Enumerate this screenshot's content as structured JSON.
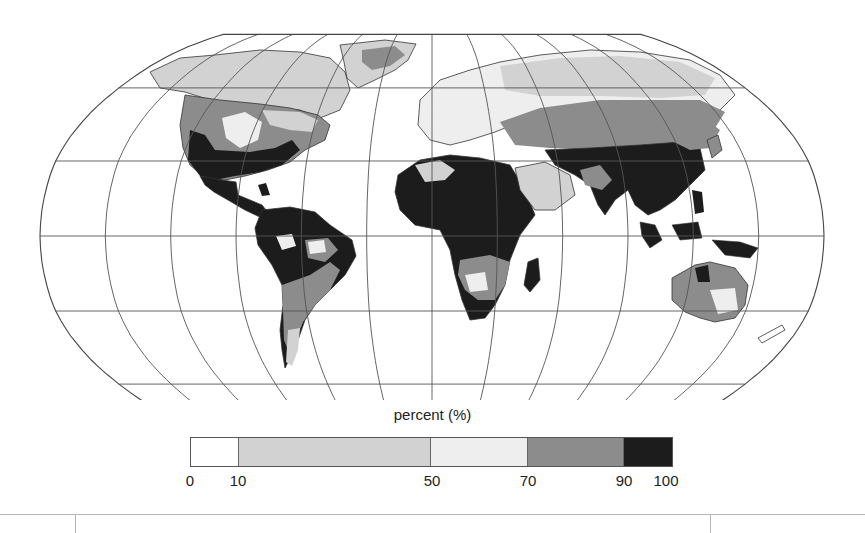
{
  "figure": {
    "type": "choropleth-world-map",
    "projection": "Robinson",
    "graticule": {
      "lon_step_deg": 30,
      "lat_step_deg": 30
    }
  },
  "legend": {
    "title": "percent (%)",
    "ticks": [
      "0",
      "10",
      "50",
      "70",
      "90",
      "100"
    ],
    "bins": [
      {
        "range": "0-10",
        "from": 0,
        "to": 10,
        "color": "#ffffff"
      },
      {
        "range": "10-50",
        "from": 10,
        "to": 50,
        "color": "#d2d2d2"
      },
      {
        "range": "50-70",
        "from": 50,
        "to": 70,
        "color": "#eeeeee"
      },
      {
        "range": "70-90",
        "from": 70,
        "to": 90,
        "color": "#8c8c8c"
      },
      {
        "range": "90-100",
        "from": 90,
        "to": 100,
        "color": "#1c1c1c"
      }
    ]
  },
  "regions": [
    {
      "name": "Alaska/Canada north",
      "bin": "10-50"
    },
    {
      "name": "Greenland",
      "bin": "10-50"
    },
    {
      "name": "Greenland interior",
      "bin": "70-90"
    },
    {
      "name": "Central North America",
      "bin": "70-90"
    },
    {
      "name": "Great Plains",
      "bin": "50-70"
    },
    {
      "name": "Southeast US / Mexico",
      "bin": "90-100"
    },
    {
      "name": "Central America",
      "bin": "90-100"
    },
    {
      "name": "Amazon/Northern South America",
      "bin": "90-100"
    },
    {
      "name": "Southern South America",
      "bin": "70-90"
    },
    {
      "name": "Patagonia",
      "bin": "10-50"
    },
    {
      "name": "Europe",
      "bin": "50-70"
    },
    {
      "name": "Northern Eurasia",
      "bin": "10-50"
    },
    {
      "name": "Central Asia",
      "bin": "70-90"
    },
    {
      "name": "North & Central Africa",
      "bin": "90-100"
    },
    {
      "name": "Arabian Peninsula",
      "bin": "10-50"
    },
    {
      "name": "Southern Africa",
      "bin": "70-90"
    },
    {
      "name": "Madagascar",
      "bin": "90-100"
    },
    {
      "name": "South & East Asia",
      "bin": "90-100"
    },
    {
      "name": "Maritime Southeast Asia",
      "bin": "90-100"
    },
    {
      "name": "Australia",
      "bin": "70-90"
    },
    {
      "name": "Central Australia",
      "bin": "50-70"
    }
  ]
}
